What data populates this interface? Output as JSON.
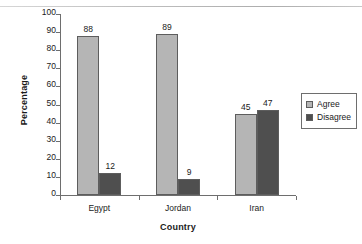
{
  "chart_data": {
    "type": "bar",
    "title": "",
    "xlabel": "Country",
    "ylabel": "Percentage",
    "categories": [
      "Egypt",
      "Jordan",
      "Iran"
    ],
    "series": [
      {
        "name": "Agree",
        "values": [
          88,
          89,
          45
        ],
        "color": "#b5b5b5"
      },
      {
        "name": "Disagree",
        "values": [
          12,
          9,
          47
        ],
        "color": "#4f4f4f"
      }
    ],
    "ylim": [
      0,
      100
    ],
    "yticks": [
      0,
      10,
      20,
      30,
      40,
      50,
      60,
      70,
      80,
      90,
      100
    ],
    "ytick_labels": [
      "0",
      "10",
      "20",
      "30",
      "40",
      "50",
      "60",
      "70",
      "80",
      "90",
      "100"
    ],
    "grid": false,
    "legend_position": "right",
    "data_labels": true
  },
  "legend": {
    "entries": [
      {
        "label": "Agree"
      },
      {
        "label": "Disagree"
      }
    ]
  }
}
